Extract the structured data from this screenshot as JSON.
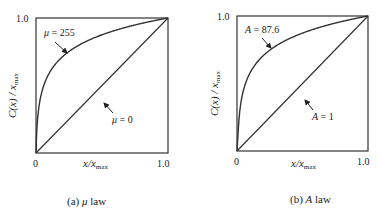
{
  "chart_data": [
    {
      "type": "line",
      "panel_label": "(a) μ law",
      "caption_prefix": "(a) ",
      "caption_symbol": "μ",
      "caption_suffix": " law",
      "xlabel": "x/x_max",
      "ylabel": "C(x) / x_max",
      "xlim": [
        0,
        1.0
      ],
      "ylim": [
        0,
        1.0
      ],
      "x_ticks": [
        "0",
        "1.0"
      ],
      "y_ticks": [
        "1.0"
      ],
      "grid": false,
      "series": [
        {
          "name": "μ = 255",
          "param": 255,
          "formula": "ln(1+μx)/ln(1+μ)"
        },
        {
          "name": "μ = 0",
          "param": 0,
          "formula": "y = x"
        }
      ],
      "annotations": [
        {
          "text": "μ = 255",
          "symbol": "μ",
          "value": "= 255",
          "target": "curve near x≈0.2"
        },
        {
          "text": "μ = 0",
          "symbol": "μ",
          "value": "= 0",
          "target": "diagonal near x≈0.45"
        }
      ]
    },
    {
      "type": "line",
      "panel_label": "(b) A law",
      "caption_prefix": "(b) ",
      "caption_symbol": "A",
      "caption_suffix": " law",
      "xlabel": "x/x_max",
      "ylabel": "C(x) / x_max",
      "xlim": [
        0,
        1.0
      ],
      "ylim": [
        0,
        1.0
      ],
      "x_ticks": [
        "0",
        "1.0"
      ],
      "y_ticks": [
        "1.0"
      ],
      "grid": false,
      "series": [
        {
          "name": "A = 87.6",
          "param": 87.6,
          "formula": "A-law compression"
        },
        {
          "name": "A = 1",
          "param": 1,
          "formula": "y = x"
        }
      ],
      "annotations": [
        {
          "text": "A = 87.6",
          "symbol": "A",
          "value": "= 87.6",
          "target": "curve near x≈0.2"
        },
        {
          "text": "A = 1",
          "symbol": "A",
          "value": "= 1",
          "target": "diagonal near x≈0.45"
        }
      ]
    }
  ],
  "labels": {
    "tick_zero": "0",
    "tick_one": "1.0",
    "x_axis_main": "x/x",
    "x_axis_sub": "max",
    "y_axis_main": "C(x) / x",
    "y_axis_sub": "max"
  }
}
